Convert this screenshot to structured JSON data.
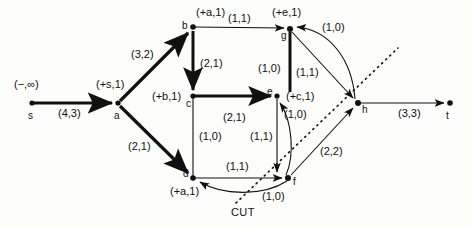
{
  "figure": {
    "kind": "network-flow-graph-with-cut",
    "cut_label": "CUT",
    "colors": {
      "ink": "#101010",
      "background": "#fdfdfc"
    }
  },
  "nodes": [
    {
      "id": "s",
      "name": "s",
      "x": 32,
      "y": 103,
      "label": "(−,∞)",
      "label_x": 14,
      "label_y": 78,
      "name_x": 28,
      "name_y": 110
    },
    {
      "id": "a",
      "name": "a",
      "x": 118,
      "y": 103,
      "label": "(+s,1)",
      "label_x": 96,
      "label_y": 78,
      "name_x": 114,
      "name_y": 110
    },
    {
      "id": "b",
      "name": "b",
      "x": 193,
      "y": 27,
      "label": "(+a,1)",
      "label_x": 196,
      "label_y": 6,
      "name_x": 182,
      "name_y": 22
    },
    {
      "id": "c",
      "name": "c",
      "x": 193,
      "y": 96,
      "label": "(+b,1)",
      "label_x": 152,
      "label_y": 90,
      "name_x": 188,
      "name_y": 100
    },
    {
      "id": "d",
      "name": "d",
      "x": 193,
      "y": 178,
      "label": "(+a,1)",
      "label_x": 170,
      "label_y": 185,
      "name_x": 184,
      "name_y": 168
    },
    {
      "id": "e",
      "name": "e",
      "x": 277,
      "y": 96,
      "label": "(+c,1)",
      "label_x": 286,
      "label_y": 90,
      "name_x": 266,
      "name_y": 88
    },
    {
      "id": "f",
      "name": "f",
      "x": 288,
      "y": 178,
      "label": "",
      "label_x": 0,
      "label_y": 0,
      "name_x": 293,
      "name_y": 177
    },
    {
      "id": "g",
      "name": "g",
      "x": 290,
      "y": 29,
      "label": "(+e,1)",
      "label_x": 272,
      "label_y": 6,
      "name_x": 282,
      "name_y": 31
    },
    {
      "id": "h",
      "name": "h",
      "x": 358,
      "y": 103,
      "label": "",
      "label_x": 0,
      "label_y": 0,
      "name_x": 362,
      "name_y": 104
    },
    {
      "id": "t",
      "name": "t",
      "x": 450,
      "y": 103,
      "label": "",
      "label_x": 0,
      "label_y": 0,
      "name_x": 446,
      "name_y": 110
    }
  ],
  "edges": [
    {
      "from": "s",
      "to": "b",
      "label": "(4,3)",
      "label_x": 58,
      "label_y": 107,
      "weight": "heavy",
      "note": "s to a"
    },
    {
      "from": "a",
      "to": "b",
      "label": "(3,2)",
      "label_x": 131,
      "label_y": 48,
      "weight": "heavy"
    },
    {
      "from": "a",
      "to": "d",
      "label": "(2,1)",
      "label_x": 128,
      "label_y": 140,
      "weight": "heavy"
    },
    {
      "from": "b",
      "to": "g",
      "label": "(1,1)",
      "label_x": 228,
      "label_y": 12,
      "weight": "light"
    },
    {
      "from": "b",
      "to": "c",
      "label": "(2,1)",
      "label_x": 200,
      "label_y": 57,
      "weight": "heavy"
    },
    {
      "from": "c",
      "to": "e",
      "label": "(2,1)",
      "label_x": 223,
      "label_y": 111,
      "weight": "heavy"
    },
    {
      "from": "c",
      "to": "d",
      "label": "(1,0)",
      "label_x": 199,
      "label_y": 130,
      "weight": "light"
    },
    {
      "from": "g",
      "to": "e",
      "label": "(1,0)",
      "label_x": 260,
      "label_y": 62,
      "weight": "heavy"
    },
    {
      "from": "g",
      "to": "h",
      "label": "(1,1)",
      "label_x": 296,
      "label_y": 66,
      "weight": "light"
    },
    {
      "from": "h",
      "to": "g",
      "label": "(1,0)",
      "label_x": 322,
      "label_y": 21,
      "weight": "light"
    },
    {
      "from": "e",
      "to": "f",
      "label": "(1,1)",
      "label_x": 252,
      "label_y": 130,
      "weight": "light"
    },
    {
      "from": "f",
      "to": "e",
      "label": "(1,0)",
      "label_x": 285,
      "label_y": 108,
      "weight": "light"
    },
    {
      "from": "d",
      "to": "f",
      "label": "(1,1)",
      "label_x": 226,
      "label_y": 160,
      "weight": "light"
    },
    {
      "from": "f",
      "to": "d",
      "label": "(1,0)",
      "label_x": 262,
      "label_y": 190,
      "weight": "light"
    },
    {
      "from": "f",
      "to": "h",
      "label": "(2,2)",
      "label_x": 320,
      "label_y": 145,
      "weight": "light"
    },
    {
      "from": "h",
      "to": "t",
      "label": "(3,3)",
      "label_x": 398,
      "label_y": 107,
      "weight": "light"
    }
  ]
}
